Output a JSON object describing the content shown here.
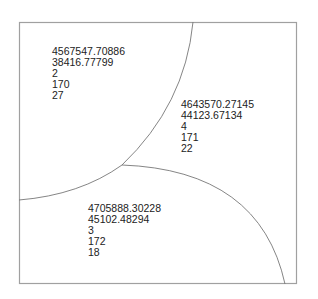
{
  "diagram": {
    "type": "voronoi-treemap",
    "frame": {
      "x": 19,
      "y": 22,
      "width": 278,
      "height": 262,
      "stroke": "#999999"
    },
    "edge_color": "#777777",
    "cells": [
      {
        "id": "cell-1",
        "lines": [
          "4567547.70886",
          "38416.77799",
          "2",
          "170",
          "27"
        ],
        "label_pos": {
          "x": 52,
          "y": 46
        }
      },
      {
        "id": "cell-2",
        "lines": [
          "4643570.27145",
          "44123.67134",
          "4",
          "171",
          "22"
        ],
        "label_pos": {
          "x": 181,
          "y": 99
        }
      },
      {
        "id": "cell-3",
        "lines": [
          "4705888.30228",
          "45102.48294",
          "3",
          "172",
          "18"
        ],
        "label_pos": {
          "x": 88,
          "y": 203
        }
      }
    ]
  }
}
